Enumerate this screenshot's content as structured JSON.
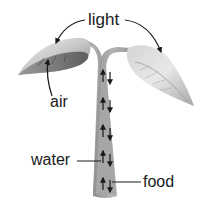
{
  "diagram": {
    "labels": {
      "light": "light",
      "air": "air",
      "water": "water",
      "food": "food"
    },
    "parts": [
      "left-leaf",
      "right-leaf",
      "stem"
    ],
    "stem_arrows": [
      {
        "direction_left": "up",
        "direction_right": "down"
      },
      {
        "direction_left": "up",
        "direction_right": "down"
      },
      {
        "direction_left": "up",
        "direction_right": "down"
      },
      {
        "direction_left": "up",
        "direction_right": "down"
      },
      {
        "direction_left": "up",
        "direction_right": "down"
      }
    ],
    "colors": {
      "leaf_light": "#e6e6e6",
      "leaf_mid": "#b9b9b9",
      "leaf_dark": "#7c7c7c",
      "stem": "#a9a9a9",
      "arrow": "#1a1a1a",
      "text": "#1a1a1a"
    }
  }
}
